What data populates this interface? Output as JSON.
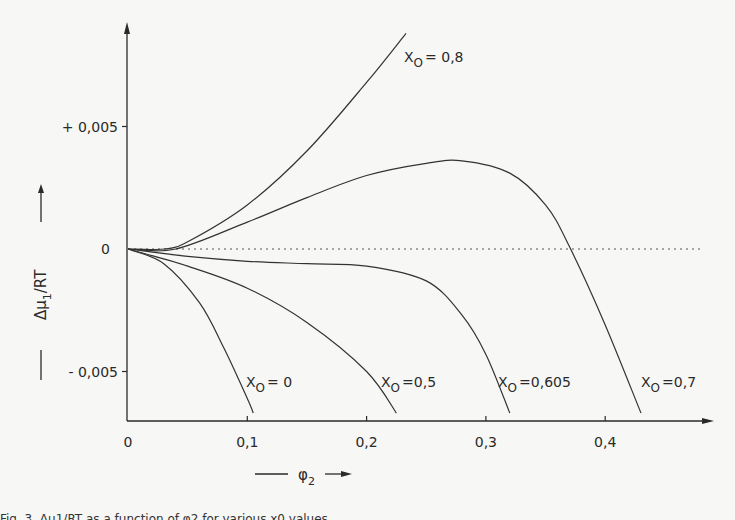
{
  "chart_data": {
    "type": "line",
    "title": "",
    "xlabel": "φ2",
    "ylabel": "Δμ1/RT",
    "xlim": [
      0,
      0.48
    ],
    "ylim": [
      -0.0069,
      0.0095
    ],
    "grid": false,
    "legend": "none (curves labelled inline)",
    "x_ticks": [
      "0",
      "0,1",
      "0,2",
      "0,3",
      "0,4"
    ],
    "x_tick_values": [
      0,
      0.1,
      0.2,
      0.3,
      0.4
    ],
    "y_ticks": [
      "+ 0,005",
      "0",
      "- 0,005"
    ],
    "y_tick_values": [
      0.005,
      0,
      -0.005
    ],
    "reference_line": {
      "y": 0,
      "style": "dotted",
      "x_end": 0.48
    },
    "series": [
      {
        "name": "x0 = 0,8",
        "label": "X",
        "sub": "O",
        "suffix": "= 0,8",
        "label_pos": [
          404,
          62
        ],
        "points": [
          [
            0,
            0
          ],
          [
            0.03,
            0
          ],
          [
            0.05,
            0.0003
          ],
          [
            0.1,
            0.0018
          ],
          [
            0.15,
            0.004
          ],
          [
            0.2,
            0.0068
          ],
          [
            0.233,
            0.0088
          ]
        ]
      },
      {
        "name": "x0 = 0,7",
        "label": "X",
        "sub": "O",
        "suffix": "=0,7",
        "label_pos": [
          641,
          387
        ],
        "points": [
          [
            0,
            0
          ],
          [
            0.04,
            0
          ],
          [
            0.1,
            0.0011
          ],
          [
            0.15,
            0.0021
          ],
          [
            0.2,
            0.003
          ],
          [
            0.25,
            0.0035
          ],
          [
            0.28,
            0.0036
          ],
          [
            0.32,
            0.0031
          ],
          [
            0.35,
            0.0018
          ],
          [
            0.37,
            0.0001
          ],
          [
            0.4,
            -0.0031
          ],
          [
            0.43,
            -0.0067
          ]
        ]
      },
      {
        "name": "x0 = 0,605",
        "label": "X",
        "sub": "O",
        "suffix": "=0,605",
        "label_pos": [
          498,
          387
        ],
        "points": [
          [
            0,
            0
          ],
          [
            0.05,
            -0.0003
          ],
          [
            0.1,
            -0.0005
          ],
          [
            0.15,
            -0.0006
          ],
          [
            0.2,
            -0.0007
          ],
          [
            0.25,
            -0.0013
          ],
          [
            0.28,
            -0.0027
          ],
          [
            0.3,
            -0.0043
          ],
          [
            0.32,
            -0.0067
          ]
        ]
      },
      {
        "name": "x0 = 0,5",
        "label": "X",
        "sub": "O",
        "suffix": "=0,5",
        "label_pos": [
          381,
          387
        ],
        "points": [
          [
            0,
            0
          ],
          [
            0.05,
            -0.0007
          ],
          [
            0.1,
            -0.0016
          ],
          [
            0.15,
            -0.003
          ],
          [
            0.2,
            -0.005
          ],
          [
            0.225,
            -0.0067
          ]
        ]
      },
      {
        "name": "x0 = 0",
        "label": "X",
        "sub": "O",
        "suffix": "= 0",
        "label_pos": [
          246,
          387
        ],
        "points": [
          [
            0,
            0
          ],
          [
            0.03,
            -0.0006
          ],
          [
            0.06,
            -0.0022
          ],
          [
            0.08,
            -0.004
          ],
          [
            0.1,
            -0.0061
          ],
          [
            0.105,
            -0.0067
          ]
        ]
      }
    ]
  },
  "axes": {
    "x_label_symbol": "φ",
    "x_label_sub": "2",
    "y_label_main": "Δμ",
    "y_label_sub": "1",
    "y_label_rest": "/RT"
  },
  "caption": "Fig. 3. Δμ1/RT as a function of φ2 for various x0 values"
}
